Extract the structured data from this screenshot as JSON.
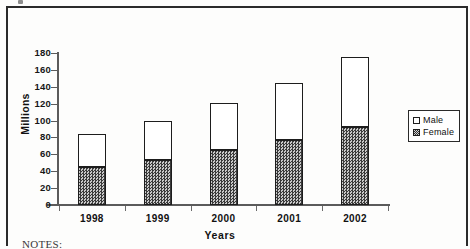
{
  "page": {
    "notes_label": "NOTES:"
  },
  "chart_data": {
    "type": "bar",
    "subtype": "stacked-vertical",
    "title": "",
    "xlabel": "Years",
    "ylabel": "Millions",
    "categories": [
      "1998",
      "1999",
      "2000",
      "2001",
      "2002"
    ],
    "series": [
      {
        "name": "Female",
        "values": [
          45,
          53,
          65,
          77,
          92
        ]
      },
      {
        "name": "Male",
        "values": [
          39,
          47,
          56,
          68,
          83
        ]
      }
    ],
    "totals": [
      84,
      100,
      121,
      145,
      175
    ],
    "ylim": [
      0,
      180
    ],
    "ytick_step": 20,
    "yticks": [
      0,
      20,
      40,
      60,
      80,
      100,
      120,
      140,
      160,
      180
    ],
    "ytick_labels": [
      "0",
      "20",
      "40",
      "60",
      "80",
      "100",
      "120",
      "140",
      "160",
      "180"
    ],
    "grid": false,
    "legend": {
      "position": "right",
      "entries": [
        {
          "label": "Male",
          "swatch": "white-open-square"
        },
        {
          "label": "Female",
          "swatch": "checkered-filled-square"
        }
      ]
    }
  }
}
